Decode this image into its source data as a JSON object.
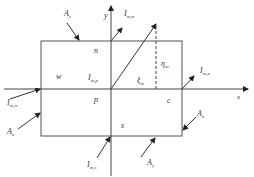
{
  "diagram": {
    "axes": {
      "x_label": "x",
      "y_label": "y"
    },
    "cells": {
      "north": "n",
      "west": "w",
      "center": "p",
      "east": "c",
      "south": "s"
    },
    "vectors": {
      "I_n": {
        "main": "I",
        "sub": "m,n"
      },
      "I_p": {
        "main": "I",
        "sub": "m,p"
      },
      "I_e": {
        "main": "I",
        "sub": "m,e"
      },
      "I_w": {
        "main": "I",
        "sub": "m,w"
      },
      "I_s": {
        "main": "I",
        "sub": "m,s"
      }
    },
    "areas": {
      "top": {
        "main": "A",
        "sub": "y"
      },
      "left": {
        "main": "A",
        "sub": "x"
      },
      "right": {
        "main": "A",
        "sub": "x"
      },
      "bottom": {
        "main": "A",
        "sub": "y"
      }
    },
    "coords": {
      "xi": {
        "main": "ξ",
        "sub": "m"
      },
      "eta": {
        "main": "η",
        "sub": "m"
      }
    },
    "colors": {
      "line": "#444444",
      "background": "#ffffff"
    }
  }
}
